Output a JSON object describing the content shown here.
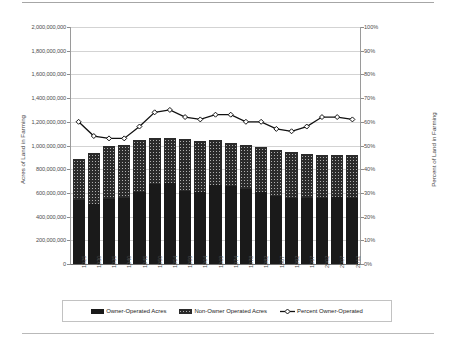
{
  "chart_data": {
    "type": "bar",
    "title": "",
    "subtitle": "",
    "xlabel": "",
    "ylabel": "Acres of Land in Farming",
    "y2label": "Percent of Land in Farming",
    "ylim": [
      0,
      2000000000
    ],
    "y2lim": [
      0,
      100
    ],
    "grid": true,
    "legend_position": "bottom",
    "stacked": true,
    "categories": [
      "1925",
      "1930",
      "1935",
      "1940",
      "1945",
      "1950",
      "1954",
      "1959",
      "1964",
      "1969",
      "1974",
      "1978",
      "1982",
      "1987",
      "1992",
      "1997",
      "2002",
      "2007",
      "2012"
    ],
    "y_tick_labels": [
      "0",
      "200,000,000",
      "400,000,000",
      "600,000,000",
      "800,000,000",
      "1,000,000,000",
      "1,200,000,000",
      "1,400,000,000",
      "1,600,000,000",
      "1,800,000,000",
      "2,000,000,000"
    ],
    "y2_tick_labels": [
      "0%",
      "10%",
      "20%",
      "30%",
      "40%",
      "50%",
      "60%",
      "70%",
      "80%",
      "90%",
      "100%"
    ],
    "series": [
      {
        "name": "Owner-Operated Acres",
        "type": "bar",
        "axis": "left",
        "color": "#1a1a1a",
        "pattern": "solid",
        "values": [
          540000000,
          505000000,
          545000000,
          555000000,
          610000000,
          675000000,
          680000000,
          620000000,
          605000000,
          665000000,
          660000000,
          635000000,
          610000000,
          575000000,
          560000000,
          560000000,
          560000000,
          565000000,
          560000000
        ]
      },
      {
        "name": "Non-Owner Operated Acres",
        "type": "bar",
        "axis": "left",
        "color": "#b0b0b0",
        "pattern": "hatched",
        "values": [
          350000000,
          430000000,
          455000000,
          450000000,
          435000000,
          390000000,
          385000000,
          435000000,
          435000000,
          385000000,
          360000000,
          370000000,
          380000000,
          390000000,
          385000000,
          370000000,
          360000000,
          355000000,
          360000000
        ]
      },
      {
        "name": "Percent Owner-Operated",
        "type": "line",
        "axis": "right",
        "color": "#111111",
        "marker": "diamond",
        "values": [
          60,
          54,
          53,
          53,
          58,
          64,
          65,
          62,
          61,
          63,
          63,
          60,
          60,
          57,
          56,
          58,
          62,
          62,
          61
        ]
      }
    ]
  },
  "legend": {
    "items": [
      {
        "label": "Owner-Operated Acres",
        "swatch": "solid"
      },
      {
        "label": "Non-Owner Operated Acres",
        "swatch": "hatched"
      },
      {
        "label": "Percent Owner-Operated",
        "swatch": "line-marker"
      }
    ]
  }
}
